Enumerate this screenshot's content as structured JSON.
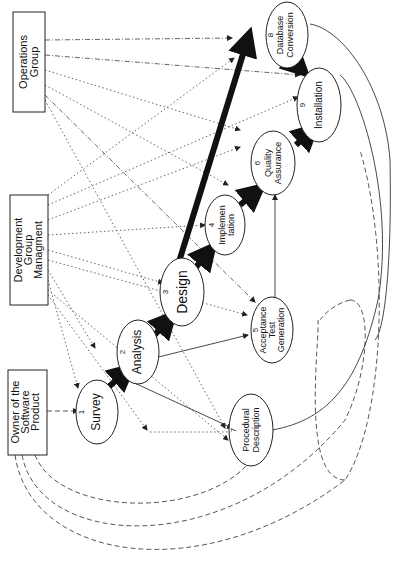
{
  "diagram": {
    "orientation": "rotated -90deg",
    "actors": [
      {
        "id": "operations",
        "lines": [
          "Operations",
          "Group"
        ]
      },
      {
        "id": "development",
        "lines": [
          "Development",
          "Group",
          "Managment"
        ]
      },
      {
        "id": "owner",
        "lines": [
          "Owner of the",
          "Software",
          "Product"
        ]
      }
    ],
    "nodes": [
      {
        "id": 1,
        "number": "1",
        "lines": [
          "Survey"
        ]
      },
      {
        "id": 2,
        "number": "2",
        "lines": [
          "Analysis"
        ]
      },
      {
        "id": 3,
        "number": "3",
        "lines": [
          "Design"
        ]
      },
      {
        "id": 4,
        "number": "4",
        "lines": [
          "Implemen",
          "tation"
        ]
      },
      {
        "id": 5,
        "number": "5",
        "lines": [
          "Acceptance",
          "Test",
          "Generation"
        ]
      },
      {
        "id": 6,
        "number": "6",
        "lines": [
          "Quality",
          "Assurance"
        ]
      },
      {
        "id": 7,
        "number": "7",
        "lines": [
          "Procedural",
          "Description"
        ]
      },
      {
        "id": 8,
        "number": "8",
        "lines": [
          "Database",
          "Conversion"
        ]
      },
      {
        "id": 9,
        "number": "9",
        "lines": [
          "Installation"
        ]
      }
    ],
    "primary_flow": [
      "1→2",
      "2→3",
      "3→4",
      "3→8",
      "4→6",
      "6→9",
      "8→9"
    ],
    "secondary_flow": [
      "2→5",
      "2→7",
      "5→6",
      "7→9"
    ],
    "colors": {
      "line": "#111111",
      "background": "#ffffff"
    }
  }
}
